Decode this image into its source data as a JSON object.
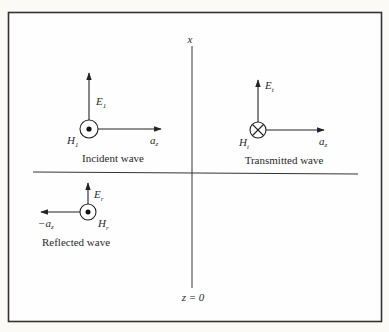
{
  "diagram": {
    "axes": {
      "vertical_axis_label": "x",
      "boundary_label": "z = 0"
    },
    "incident": {
      "caption": "Incident wave",
      "e_field": {
        "symbol": "E",
        "subscript": "1"
      },
      "h_field": {
        "symbol": "H",
        "subscript": "1",
        "direction": "out-of-page"
      },
      "propagation": {
        "symbol": "a",
        "subscript": "z"
      }
    },
    "transmitted": {
      "caption": "Transmitted wave",
      "e_field": {
        "symbol": "E",
        "subscript": "t"
      },
      "h_field": {
        "symbol": "H",
        "subscript": "t",
        "direction": "into-page"
      },
      "propagation": {
        "symbol": "a",
        "subscript": "z"
      }
    },
    "reflected": {
      "caption": "Reflected wave",
      "e_field": {
        "symbol": "E",
        "subscript": "r"
      },
      "h_field": {
        "symbol": "H",
        "subscript": "r",
        "direction": "out-of-page"
      },
      "propagation": {
        "symbol": "−a",
        "subscript": "z"
      }
    }
  },
  "colors": {
    "background": "#fbfaf6",
    "ink": "#2a2a2a"
  }
}
